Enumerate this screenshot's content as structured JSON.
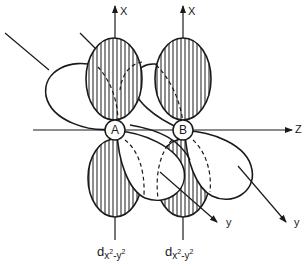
{
  "figure": {
    "colors": {
      "stroke": "#1a1a1a",
      "background": "#ffffff"
    }
  },
  "atoms": [
    {
      "label": "A"
    },
    {
      "label": "B"
    }
  ],
  "axes": {
    "x_axis_A": "X",
    "x_axis_B": "X",
    "z_axis": "Z",
    "y_axis_A": "y",
    "y_axis_B": "y"
  },
  "orbital_labels": [
    {
      "main": "d",
      "sub_a": "x",
      "sup_a": "2",
      "sep": "-",
      "sub_b": "y",
      "sup_b": "2"
    },
    {
      "main": "d",
      "sub_a": "x",
      "sup_a": "2",
      "sep": "-",
      "sub_b": "y",
      "sup_b": "2"
    }
  ]
}
